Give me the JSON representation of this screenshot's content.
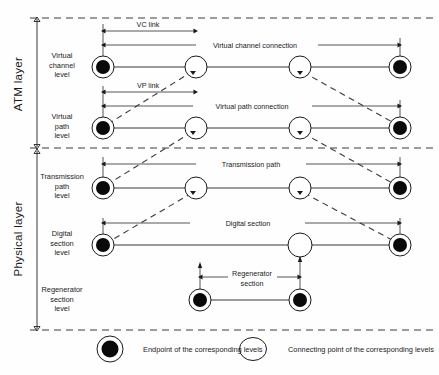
{
  "figure": {
    "layers": [
      {
        "name": "atm-layer",
        "label": "ATM layer"
      },
      {
        "name": "physical-layer",
        "label": "Physical layer"
      }
    ],
    "rows": [
      {
        "name": "virtual-channel-level",
        "label_lines": [
          "Virtual",
          "channel",
          "level"
        ]
      },
      {
        "name": "virtual-path-level",
        "label_lines": [
          "Virtual",
          "path",
          "level"
        ]
      },
      {
        "name": "transmission-path-level",
        "label_lines": [
          "Transmission",
          "path",
          "level"
        ]
      },
      {
        "name": "digital-section-level",
        "label_lines": [
          "Digital",
          "section",
          "level"
        ]
      },
      {
        "name": "regenerator-section-level",
        "label_lines": [
          "Regenerator",
          "section",
          "level"
        ]
      }
    ],
    "span_labels": {
      "vc_link": "VC link",
      "vp_link": "VP link",
      "virtual_channel_connection": "Virtual channel connection",
      "virtual_path_connection": "Virtual path connection",
      "transmission_path": "Transmission path",
      "digital_section": "Digital section",
      "regenerator_section_line1": "Regenerator",
      "regenerator_section_line2": "section"
    },
    "legend": [
      {
        "name": "legend-endpoint",
        "symbol": "filled-double-circle",
        "text": "Endpoint of the corresponding levels"
      },
      {
        "name": "legend-connecting-point",
        "symbol": "hollow-circle",
        "text": "Connecting point of the corresponding levels"
      }
    ],
    "colors": {
      "ink": "#1a1a1a",
      "line": "#222222",
      "dashed": "#3a3a3a",
      "node_fill": "#0a0a0a",
      "background": "#fefefe"
    }
  }
}
